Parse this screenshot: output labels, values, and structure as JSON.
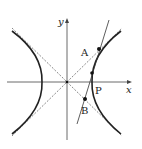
{
  "diagram": {
    "axes": {
      "x_label": "x",
      "y_label": "y"
    },
    "points": {
      "A": "A",
      "B": "B",
      "P": "P"
    },
    "colors": {
      "curve": "#222222",
      "axis": "#444444",
      "asymptote": "#555555"
    }
  }
}
